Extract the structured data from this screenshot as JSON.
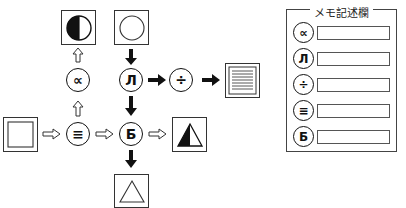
{
  "diagram": {
    "nodes": [
      {
        "id": "proportional",
        "symbol": "∝",
        "name": "proportional-node"
      },
      {
        "id": "pulse",
        "symbol": "Л",
        "name": "pulse-node"
      },
      {
        "id": "divide",
        "symbol": "÷",
        "name": "divide-node"
      },
      {
        "id": "triple_bar",
        "symbol": "≡",
        "name": "triple-bar-node"
      },
      {
        "id": "be",
        "symbol": "Б",
        "name": "be-node"
      }
    ],
    "boxes": [
      {
        "id": "start",
        "content": "square"
      },
      {
        "id": "half_circle",
        "content": "half-filled-circle"
      },
      {
        "id": "circle",
        "content": "circle"
      },
      {
        "id": "lines",
        "content": "horizontal-lines"
      },
      {
        "id": "half_triangle",
        "content": "half-filled-triangle"
      },
      {
        "id": "triangle",
        "content": "triangle"
      }
    ],
    "arrows": [
      {
        "from": "start",
        "to": "triple_bar",
        "style": "outline"
      },
      {
        "from": "triple_bar",
        "to": "proportional",
        "style": "outline"
      },
      {
        "from": "proportional",
        "to": "half_circle",
        "style": "outline"
      },
      {
        "from": "triple_bar",
        "to": "be",
        "style": "outline"
      },
      {
        "from": "be",
        "to": "half_triangle",
        "style": "outline"
      },
      {
        "from": "circle",
        "to": "pulse",
        "style": "solid"
      },
      {
        "from": "pulse",
        "to": "be",
        "style": "solid"
      },
      {
        "from": "pulse",
        "to": "divide",
        "style": "solid"
      },
      {
        "from": "divide",
        "to": "lines",
        "style": "solid"
      },
      {
        "from": "be",
        "to": "triangle",
        "style": "solid"
      }
    ]
  },
  "memo": {
    "title": "メモ記述欄",
    "rows": [
      {
        "symbol": "∝",
        "value": ""
      },
      {
        "symbol": "Л",
        "value": ""
      },
      {
        "symbol": "÷",
        "value": ""
      },
      {
        "symbol": "≡",
        "value": ""
      },
      {
        "symbol": "Б",
        "value": ""
      }
    ]
  }
}
